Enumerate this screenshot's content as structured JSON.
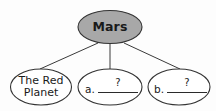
{
  "diagram": {
    "type": "concept-map",
    "background_color": "#fdfdfd",
    "stroke_color": "#333333",
    "root": {
      "label": "Mars",
      "fill_color": "#a8a8a8",
      "text_color": "#1a1a1a"
    },
    "children": [
      {
        "id": "red-planet",
        "label_line1": "The Red",
        "label_line2": "Planet",
        "fill_color": "#ffffff",
        "has_blank": false
      },
      {
        "id": "node-a",
        "letter": "a.",
        "placeholder": "?",
        "fill_color": "#ffffff",
        "has_blank": true
      },
      {
        "id": "node-b",
        "letter": "b.",
        "placeholder": "?",
        "fill_color": "#ffffff",
        "has_blank": true
      }
    ]
  }
}
